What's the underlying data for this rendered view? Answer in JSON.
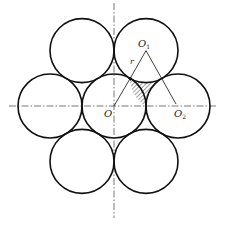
{
  "diagram": {
    "title": "",
    "type": "hexagonal close packing of seven equal circles",
    "center": {
      "x": 114,
      "y": 106
    },
    "radius": 32,
    "circles": [
      {
        "id": "center",
        "cx": 114,
        "cy": 106
      },
      {
        "id": "top-left",
        "cx": 82,
        "cy": 50.6
      },
      {
        "id": "top-right",
        "cx": 146,
        "cy": 50.6
      },
      {
        "id": "left",
        "cx": 50,
        "cy": 106
      },
      {
        "id": "right",
        "cx": 178,
        "cy": 106
      },
      {
        "id": "bottom-left",
        "cx": 82,
        "cy": 161.4
      },
      {
        "id": "bottom-right",
        "cx": 146,
        "cy": 161.4
      }
    ],
    "labels": {
      "O": "O",
      "O1_main": "O",
      "O1_sub": "1",
      "O2_main": "O",
      "O2_sub": "2",
      "r": "r"
    },
    "colors": {
      "stroke": "#111111",
      "hatch": "#444444",
      "axis": "#555555"
    }
  }
}
